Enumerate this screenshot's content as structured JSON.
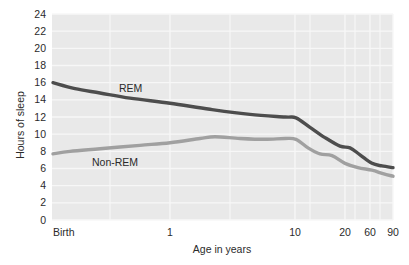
{
  "chart_data": {
    "type": "line",
    "title": "",
    "xlabel": "Age in years",
    "ylabel": "Hours of sleep",
    "grid": true,
    "legend_position": "inline-annotation",
    "plot_background": "#e9e9e9",
    "gridline_color": "#f7f7f7",
    "ylim": [
      0,
      24
    ],
    "yticks": [
      0,
      2,
      4,
      6,
      8,
      10,
      12,
      14,
      16,
      18,
      20,
      22,
      24
    ],
    "ytick_labels": [
      "0",
      "2",
      "4",
      "6",
      "8",
      "10",
      "12",
      "14",
      "16",
      "18",
      "20",
      "22",
      "24"
    ],
    "xtick_labels": [
      "Birth",
      "1",
      "10",
      "20",
      "60",
      "90"
    ],
    "xtick_positions_px": [
      52,
      170,
      295,
      345,
      370,
      393
    ],
    "x_scale_note": "compressed/logarithmic age axis",
    "series": [
      {
        "name": "REM",
        "color": "#4d4d4d",
        "label_text": "REM",
        "points": [
          {
            "x_px": 53,
            "age": "Birth",
            "hours": 16.0
          },
          {
            "x_px": 75,
            "age": "0.1",
            "hours": 15.3
          },
          {
            "x_px": 100,
            "age": "0.3",
            "hours": 14.8
          },
          {
            "x_px": 130,
            "age": "0.6",
            "hours": 14.2
          },
          {
            "x_px": 170,
            "age": "1",
            "hours": 13.6
          },
          {
            "x_px": 210,
            "age": "3",
            "hours": 12.9
          },
          {
            "x_px": 250,
            "age": "6",
            "hours": 12.3
          },
          {
            "x_px": 285,
            "age": "9",
            "hours": 12.0
          },
          {
            "x_px": 296,
            "age": "10",
            "hours": 11.9
          },
          {
            "x_px": 310,
            "age": "13",
            "hours": 10.8
          },
          {
            "x_px": 325,
            "age": "16",
            "hours": 9.6
          },
          {
            "x_px": 340,
            "age": "19",
            "hours": 8.6
          },
          {
            "x_px": 350,
            "age": "22",
            "hours": 8.4
          },
          {
            "x_px": 360,
            "age": "35",
            "hours": 7.6
          },
          {
            "x_px": 372,
            "age": "60",
            "hours": 6.6
          },
          {
            "x_px": 382,
            "age": "75",
            "hours": 6.3
          },
          {
            "x_px": 393,
            "age": "90",
            "hours": 6.1
          }
        ]
      },
      {
        "name": "Non-REM",
        "color": "#a0a0a0",
        "label_text": "Non-REM",
        "points": [
          {
            "x_px": 53,
            "age": "Birth",
            "hours": 7.7
          },
          {
            "x_px": 70,
            "age": "0.1",
            "hours": 8.0
          },
          {
            "x_px": 100,
            "age": "0.3",
            "hours": 8.3
          },
          {
            "x_px": 140,
            "age": "0.8",
            "hours": 8.7
          },
          {
            "x_px": 170,
            "age": "1",
            "hours": 9.0
          },
          {
            "x_px": 200,
            "age": "2.5",
            "hours": 9.5
          },
          {
            "x_px": 215,
            "age": "3",
            "hours": 9.7
          },
          {
            "x_px": 240,
            "age": "5",
            "hours": 9.5
          },
          {
            "x_px": 265,
            "age": "7",
            "hours": 9.4
          },
          {
            "x_px": 285,
            "age": "9",
            "hours": 9.5
          },
          {
            "x_px": 296,
            "age": "10",
            "hours": 9.4
          },
          {
            "x_px": 308,
            "age": "12",
            "hours": 8.4
          },
          {
            "x_px": 320,
            "age": "15",
            "hours": 7.7
          },
          {
            "x_px": 332,
            "age": "17",
            "hours": 7.5
          },
          {
            "x_px": 345,
            "age": "20",
            "hours": 6.6
          },
          {
            "x_px": 358,
            "age": "35",
            "hours": 6.1
          },
          {
            "x_px": 372,
            "age": "60",
            "hours": 5.8
          },
          {
            "x_px": 383,
            "age": "75",
            "hours": 5.4
          },
          {
            "x_px": 393,
            "age": "90",
            "hours": 5.1
          }
        ]
      }
    ]
  },
  "axes": {
    "y_title": "Hours of sleep",
    "x_title": "Age in years",
    "y_ticks": [
      "24",
      "22",
      "20",
      "18",
      "16",
      "14",
      "12",
      "10",
      "8",
      "6",
      "4",
      "2",
      "0"
    ],
    "x_ticks": [
      "Birth",
      "1",
      "10",
      "20",
      "60",
      "90"
    ]
  },
  "annotations": {
    "rem_label": "REM",
    "nonrem_label": "Non-REM"
  },
  "colors": {
    "rem": "#4d4d4d",
    "nonrem": "#a0a0a0",
    "plot_bg": "#e9e9e9",
    "grid": "#f7f7f7",
    "text": "#2b2b2b"
  }
}
